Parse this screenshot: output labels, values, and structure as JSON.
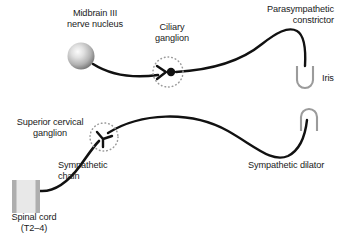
{
  "figure": {
    "title_implied": "Autonomic innervation of the iris",
    "background_color": "#ffffff",
    "width": 348,
    "height": 246
  },
  "colors": {
    "nerve_stroke": "#111111",
    "ganglion_dotted": "#9a9a9a",
    "iris_gray": "#9b9b9b",
    "spinal_cord_fill": "#e2e2e2",
    "spinal_cord_edge": "#a9a9a9",
    "text": "#1a1a1a",
    "sphere_light": "#f2f2f2",
    "sphere_mid": "#bcbcbc",
    "sphere_dark": "#6f6f6f"
  },
  "labels": {
    "midbrain_nucleus": "Midbrain III\nnerve nucleus",
    "ciliary_ganglion": "Ciliary\nganglion",
    "parasympathetic_constrictor": "Parasympathetic\nconstrictor",
    "iris": "Iris",
    "superior_cervical_ganglion": "Superior cervical\nganglion",
    "sympathetic_chain": "Sympathetic\nchain",
    "sympathetic_dilator": "Sympathetic dilator",
    "spinal_cord": "Spinal cord\n(T2–4)"
  },
  "structures": {
    "midbrain_nucleus_sphere": {
      "center_x": 81,
      "center_y": 56,
      "radius": 13.5
    },
    "ciliary_ganglion_marker": {
      "center_x": 168,
      "center_y": 72,
      "dotted_radius": 15,
      "synapse_dot_radius": 4.2
    },
    "superior_cervical_ganglion_marker": {
      "center_x": 104,
      "center_y": 137,
      "dotted_radius": 14
    },
    "spinal_cord_block": {
      "x": 12,
      "y": 180,
      "width": 28,
      "height": 33
    },
    "iris_parasympathetic_u": {
      "orientation": "u-shape",
      "x": 297,
      "y": 66,
      "width": 16,
      "height": 24
    },
    "iris_sympathetic_u": {
      "orientation": "inverted-u-shape",
      "x": 301,
      "y": 107,
      "width": 16,
      "height": 24
    }
  },
  "pathways": [
    {
      "name": "parasympathetic-pathway",
      "from": "Midbrain III nerve nucleus",
      "synapse_at": "Ciliary ganglion",
      "to": "Parasympathetic constrictor (iris)"
    },
    {
      "name": "sympathetic-pathway",
      "from": "Spinal cord (T2–4)",
      "synapse_at": "Superior cervical ganglion",
      "to": "Sympathetic dilator (iris)"
    }
  ]
}
